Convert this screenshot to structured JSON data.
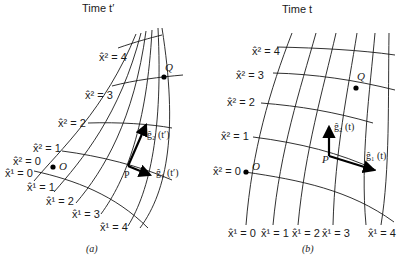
{
  "panels": [
    {
      "id": "a",
      "title": "Time t′",
      "caption": "(a)",
      "x2_labels": [
        "x̂² = 4",
        "x̂² = 3",
        "x̂² = 2",
        "x̂² = 1",
        "x̂² = 0"
      ],
      "x1_labels": [
        "x̂¹ = 0",
        "x̂¹ = 1",
        "x̂¹ = 2",
        "x̂¹ = 3",
        "x̂¹ = 4"
      ],
      "points": {
        "origin": "O",
        "p": "P",
        "q": "Q"
      },
      "vectors": {
        "g1": "ĝ₁ (t′)",
        "g2": "ĝ₂ (t′)"
      }
    },
    {
      "id": "b",
      "title": "Time t",
      "caption": "(b)",
      "x2_labels": [
        "x̂² = 4",
        "x̂² = 3",
        "x̂² = 2",
        "x̂² = 1",
        "x̂² = 0"
      ],
      "x1_labels": [
        "x̂¹ = 0",
        "x̂¹ = 1",
        "x̂¹ = 2",
        "x̂¹ = 3",
        "x̂¹ = 4"
      ],
      "points": {
        "origin": "O",
        "p": "P",
        "q": "Q"
      },
      "vectors": {
        "g1": "ĝ₁ (t)",
        "g2": "ĝ₂ (t)"
      }
    }
  ]
}
